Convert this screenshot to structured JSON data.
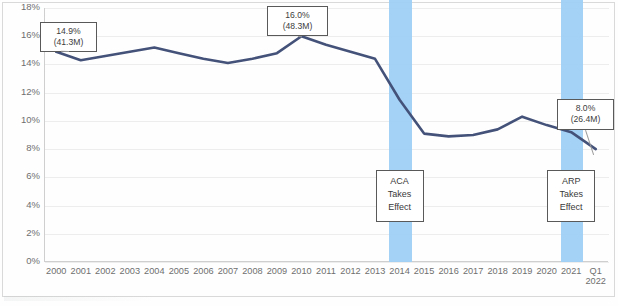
{
  "chart_data": {
    "type": "line",
    "title": "",
    "xlabel": "",
    "ylabel": "",
    "ylim": [
      0,
      18
    ],
    "ytick_labels": [
      "18%",
      "16%",
      "14%",
      "12%",
      "10%",
      "8%",
      "6%",
      "4%",
      "2%",
      "0%"
    ],
    "ytick_values": [
      18,
      16,
      14,
      12,
      10,
      8,
      6,
      4,
      2,
      0
    ],
    "grid": true,
    "legend": "none",
    "categories": [
      "2000",
      "2001",
      "2002",
      "2003",
      "2004",
      "2005",
      "2006",
      "2007",
      "2008",
      "2009",
      "2010",
      "2011",
      "2012",
      "2013",
      "2014",
      "2015",
      "2016",
      "2017",
      "2018",
      "2019",
      "2020",
      "2021",
      "Q1 2022"
    ],
    "series": [
      {
        "name": "Uninsured rate",
        "color": "#44527a",
        "values": [
          14.9,
          14.3,
          14.6,
          14.9,
          15.2,
          14.8,
          14.4,
          14.1,
          14.4,
          14.8,
          16.0,
          15.4,
          14.9,
          14.4,
          11.5,
          9.1,
          8.9,
          9.0,
          9.4,
          10.3,
          9.7,
          9.2,
          8.0
        ]
      }
    ],
    "annotations": [
      {
        "name": "callout-2000",
        "category": "2000",
        "percent": "14.9%",
        "count": "(41.3M)"
      },
      {
        "name": "callout-2010",
        "category": "2010",
        "percent": "16.0%",
        "count": "(48.3M)"
      },
      {
        "name": "callout-q1-2022",
        "category": "Q1 2022",
        "percent": "8.0%",
        "count": "(26.4M)"
      }
    ],
    "bands": [
      {
        "name": "aca-band",
        "category": "2014",
        "color": "#9fd0f5",
        "label_lines": [
          "ACA",
          "Takes",
          "Effect"
        ]
      },
      {
        "name": "arp-band",
        "category": "2021",
        "color": "#9fd0f5",
        "label_lines": [
          "ARP",
          "Takes",
          "Effect"
        ]
      }
    ]
  },
  "callouts": {
    "first": {
      "percent": "14.9%",
      "count": "(41.3M)"
    },
    "peak": {
      "percent": "16.0%",
      "count": "(48.3M)"
    },
    "last": {
      "percent": "8.0%",
      "count": "(26.4M)"
    }
  },
  "events": {
    "aca": {
      "l1": "ACA",
      "l2": "Takes",
      "l3": "Effect"
    },
    "arp": {
      "l1": "ARP",
      "l2": "Takes",
      "l3": "Effect"
    }
  },
  "xaxis": {
    "last_label_line1": "Q1",
    "last_label_line2": "2022"
  }
}
